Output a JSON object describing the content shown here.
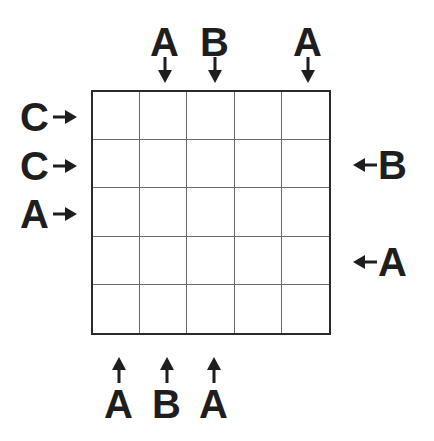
{
  "puzzle": {
    "grid": {
      "rows": 5,
      "cols": 5,
      "cells": [
        [
          "",
          "",
          "",
          "",
          ""
        ],
        [
          "",
          "",
          "",
          "",
          ""
        ],
        [
          "",
          "",
          "",
          "",
          ""
        ],
        [
          "",
          "",
          "",
          "",
          ""
        ],
        [
          "",
          "",
          "",
          "",
          ""
        ]
      ]
    },
    "clues": {
      "top": [
        {
          "col": 1,
          "letter": "A",
          "x": 165
        },
        {
          "col": 2,
          "letter": "B",
          "x": 215
        },
        {
          "col": 4,
          "letter": "A",
          "x": 308
        }
      ],
      "left": [
        {
          "row": 0,
          "letter": "C",
          "y": 117
        },
        {
          "row": 1,
          "letter": "C",
          "y": 166
        },
        {
          "row": 2,
          "letter": "A",
          "y": 214
        }
      ],
      "right": [
        {
          "row": 1,
          "letter": "B",
          "y": 165
        },
        {
          "row": 3,
          "letter": "A",
          "y": 262
        }
      ],
      "bottom": [
        {
          "col": 0,
          "letter": "A",
          "x": 119
        },
        {
          "col": 1,
          "letter": "B",
          "x": 167
        },
        {
          "col": 2,
          "letter": "A",
          "x": 214
        }
      ]
    },
    "colors": {
      "ink": "#1e1e1e",
      "grid_line": "#6a6a6a",
      "background": "#ffffff"
    }
  }
}
